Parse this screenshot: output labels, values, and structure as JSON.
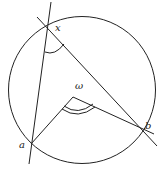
{
  "diagram": {
    "circle": {
      "cx": 82,
      "cy": 90,
      "r": 73.5
    },
    "center": {
      "label": "ω",
      "x": 73,
      "y": 97,
      "label_x": 75,
      "label_y": 89
    },
    "points": [
      {
        "id": "x",
        "label": "x",
        "x": 48,
        "y": 27,
        "label_x": 55,
        "label_y": 31
      },
      {
        "id": "a",
        "label": "a",
        "x": 31,
        "y": 144,
        "label_x": 19,
        "label_y": 148
      },
      {
        "id": "b",
        "label": "b",
        "x": 140,
        "y": 125,
        "label_x": 145,
        "label_y": 129
      }
    ],
    "lines": [
      {
        "id": "line-xa",
        "x1": 51,
        "y1": 2,
        "x2": 29,
        "y2": 164
      },
      {
        "id": "line-xb",
        "x1": 37,
        "y1": 17,
        "x2": 157,
        "y2": 146
      },
      {
        "id": "segment-omega-a",
        "x1": 73,
        "y1": 97,
        "x2": 31,
        "y2": 144
      },
      {
        "id": "segment-omega-b",
        "x1": 73,
        "y1": 97,
        "x2": 154,
        "y2": 134
      }
    ],
    "stroke_color": "#222222",
    "angle_marks": {
      "inscribed_at_x": "single arc",
      "central_at_omega": "double arc"
    }
  }
}
